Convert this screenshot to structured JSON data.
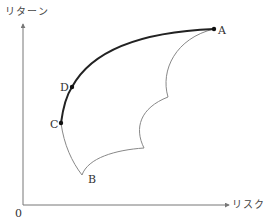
{
  "axes": {
    "y_label": "リターン",
    "x_label": "リスク",
    "origin_label": "0",
    "color": "#777777"
  },
  "points": {
    "A": {
      "label": "A",
      "x": 214,
      "y": 29
    },
    "B": {
      "label": "B",
      "x": 82,
      "y": 175
    },
    "C": {
      "label": "C",
      "x": 61,
      "y": 123
    },
    "D": {
      "label": "D",
      "x": 72,
      "y": 87
    }
  },
  "curves": {
    "efficient_frontier": {
      "from": "C",
      "through": "D",
      "to": "A",
      "color": "#222222",
      "width": 2
    },
    "feasible_region_boundary": {
      "color": "#888888",
      "width": 1
    }
  }
}
